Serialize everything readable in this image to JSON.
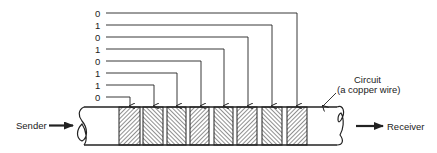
{
  "diagram": {
    "sender_label": "Sender",
    "receiver_label": "Receiver",
    "circuit_label_line1": "Circuit",
    "circuit_label_line2": "(a copper wire)",
    "bits_top_to_bottom": [
      "0",
      "1",
      "0",
      "1",
      "0",
      "1",
      "1",
      "0"
    ],
    "bits_on_wire_left_to_right": [
      "0",
      "1",
      "1",
      "0",
      "1",
      "0",
      "1",
      "0"
    ],
    "colors": {
      "line": "#222222",
      "background": "#ffffff"
    }
  }
}
